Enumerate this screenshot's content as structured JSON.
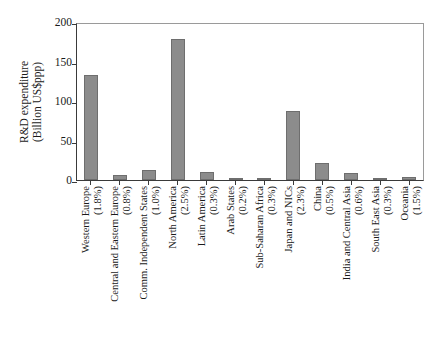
{
  "chart_data": {
    "type": "bar",
    "title": "",
    "xlabel": "",
    "ylabel": "R&D expenditure (Billion US$ppp)",
    "ylabel_line1": "R&D expenditure",
    "ylabel_line2": "(Billion US$ppp)",
    "ylim": [
      0,
      200
    ],
    "yticks": [
      0,
      50,
      100,
      150,
      200
    ],
    "ytick_labels": [
      "0",
      "50",
      "100",
      "150",
      "200"
    ],
    "grid": false,
    "legend": "none",
    "categories": [
      "Western Europe",
      "Central and Eastern Europe",
      "Comm. Independent States",
      "North America",
      "Latin America",
      "Arab States",
      "Sub-Saharan Africa",
      "Japan and NICs",
      "China",
      "India and Central Asia",
      "South East Asia",
      "Oceania"
    ],
    "category_sublabels": [
      "(1.8%)",
      "(0.8%)",
      "(1.0%)",
      "(2.5%)",
      "(0.3%)",
      "(0.2%)",
      "(0.3%)",
      "(2.3%)",
      "(0.5%)",
      "(0.6%)",
      "(0.3%)",
      "(1.5%)"
    ],
    "values": [
      133,
      6,
      13,
      178,
      10,
      2,
      3,
      87,
      22,
      9,
      2,
      4
    ],
    "bar_color": "#8c8c8c",
    "bar_edge_color": "#6e6e6e",
    "axis_color": "#3a3a3a"
  }
}
